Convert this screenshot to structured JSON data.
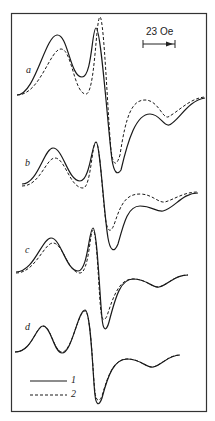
{
  "figure": {
    "scale_bar_label": "23 Oe",
    "panel_labels": [
      "a",
      "b",
      "c",
      "d"
    ],
    "legend": [
      {
        "label": "1",
        "style": "solid"
      },
      {
        "label": "2",
        "style": "dashed"
      }
    ],
    "colors": {
      "line": "#1a1a1a",
      "frame": "#333333",
      "background": "#ffffff"
    }
  },
  "chart_data": {
    "type": "line",
    "title": "",
    "xlabel": "Magnetic field",
    "ylabel": "",
    "scale_bar": "23 Oe",
    "grid": false,
    "legend_position": "bottom-left",
    "legend": [
      "1",
      "2"
    ],
    "panels": [
      {
        "label": "a",
        "series": [
          {
            "name": "1",
            "style": "solid",
            "path": "M17,95 C35,95 45,36 57,35 C68,34 70,77 82,77 C92,77 92,28 96,28 C101,28 108,130 112,160 C114,172 117,176 121,170 C128,140 136,114 150,114 C160,114 163,126 169,125 C178,122 188,100 205,98"
          },
          {
            "name": "2",
            "style": "dashed",
            "path": "M17,95 C40,95 50,49 61,49 C72,49 74,94 86,94 C95,94 96,17 100,17 C104,17 108,120 111,150 C113,165 116,168 120,155 C126,115 132,100 145,100 C158,100 162,118 168,117 C178,112 190,98 205,97"
          }
        ]
      },
      {
        "label": "b",
        "series": [
          {
            "name": "1",
            "style": "solid",
            "path": "M22,184 C38,184 44,148 53,148 C63,148 68,181 80,181 C90,181 92,142 96,142 C100,142 104,215 108,238 C110,250 114,254 118,244 C124,222 128,206 140,206 C152,206 156,212 163,211 C175,208 182,193 198,193"
          },
          {
            "name": "2",
            "style": "dashed",
            "path": "M22,186 C40,186 46,158 55,158 C65,158 70,188 83,188 C91,188 92,142 96,142 C100,142 103,205 106,222 C108,232 111,234 115,222 C121,204 126,194 140,194 C152,194 158,203 165,202 C175,199 184,192 198,192"
          }
        ]
      },
      {
        "label": "c",
        "series": [
          {
            "name": "1",
            "style": "solid",
            "path": "M16,272 C34,272 42,238 51,238 C61,238 66,271 78,271 C88,271 89,228 93,228 C97,228 100,300 102,318 C103,330 106,333 109,322 C116,295 121,279 133,279 C147,279 152,288 159,287 C168,285 174,275 188,275"
          },
          {
            "name": "2",
            "style": "dashed",
            "path": "M16,273 C35,273 44,243 53,243 C63,243 68,273 80,273 C89,273 90,230 93,230 C97,230 99,298 101,312 C102,320 104,322 107,316 C114,294 120,279 133,279 C147,279 152,288 159,287 C168,285 174,275 188,275"
          }
        ]
      },
      {
        "label": "d",
        "series": [
          {
            "name": "1",
            "style": "solid",
            "path": "M15,352 C32,352 36,326 43,326 C51,326 54,353 62,353 C72,353 78,310 85,310 C91,310 93,380 95,395 C96,405 99,407 102,398 C108,375 114,359 127,359 C141,359 146,368 153,367 C162,365 168,355 180,355"
          },
          {
            "name": "2",
            "style": "dashed",
            "path": "M15,352 C32,352 36,326 43,326 C51,326 54,352 62,352 C72,352 78,311 85,311 C91,311 93,378 95,392 C96,401 99,403 102,396 C108,375 114,359 127,359 C141,359 146,368 153,367 C162,365 168,355 180,355"
          }
        ]
      }
    ]
  }
}
